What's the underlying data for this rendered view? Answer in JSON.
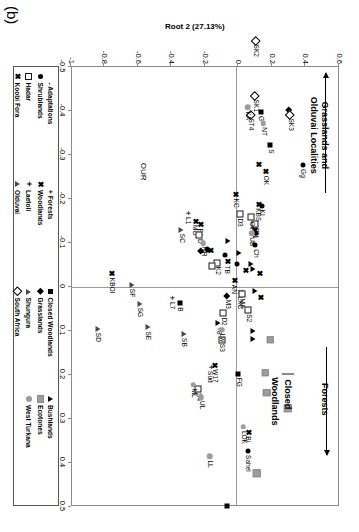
{
  "figure": {
    "panel_label": "(b)"
  },
  "chart_data": {
    "type": "scatter",
    "title": "",
    "xlabel": "Root 1 (45.45%)",
    "ylabel": "Root 2 (27.13%)",
    "xlim": [
      -0.5,
      0.5
    ],
    "ylim": [
      -1.0,
      0.6
    ],
    "xticks": [
      "-0.5",
      "-0.4",
      "-0.3",
      "-0.2",
      "-0.1",
      "0",
      "0.1",
      "0.2",
      "0.3",
      "0.4",
      "0.5"
    ],
    "xtick_values": [
      -0.5,
      -0.4,
      -0.3,
      -0.2,
      -0.1,
      0,
      0.1,
      0.2,
      0.3,
      0.4,
      0.5
    ],
    "yticks": [
      "0.6",
      "0.4",
      "0.2",
      "0",
      "-0.2",
      "-0.4",
      "-0.6",
      "-0.8",
      "-1"
    ],
    "ytick_values": [
      0.6,
      0.4,
      0.2,
      0,
      -0.2,
      -0.4,
      -0.6,
      -0.8,
      -1.0
    ],
    "grid": false,
    "zero_lines": true,
    "legend_position": "below-plot",
    "annotations": [
      {
        "name": "forests-annotation",
        "text": "Forests",
        "x": 0.255,
        "y": 0.52,
        "arrow": "horizontal-right"
      },
      {
        "name": "grasslands-annotation",
        "text": "Grasslands and\nOlduvai Localities",
        "x": -0.345,
        "y": 0.49,
        "arrow": "horizontal-left"
      },
      {
        "name": "our-annotation",
        "text": "OUR",
        "x": -0.262,
        "y": -0.565
      }
    ],
    "inline_key": [
      {
        "label": "Closed",
        "marker": "square-grey"
      },
      {
        "label": "Woodlands",
        "marker": "square-filled"
      }
    ],
    "series": [
      {
        "name": "Adaptations",
        "marker": "dash",
        "points": []
      },
      {
        "name": "Forests",
        "marker": "plus",
        "points": [
          {
            "label": "L1",
            "x": -0.168,
            "y": -0.3
          },
          {
            "label": "L7",
            "x": 0.025,
            "y": -0.395
          }
        ]
      },
      {
        "name": "Closed Woodlands",
        "marker": "square-filled",
        "points": [
          {
            "label": "S",
            "x": -0.322,
            "y": 0.195
          },
          {
            "label": "G",
            "x": -0.398,
            "y": 0.14
          },
          {
            "label": "B",
            "x": 0.037,
            "y": -0.345
          },
          {
            "label": "FG",
            "x": 0.197,
            "y": 0.005
          },
          {
            "label": "",
            "x": 0.498,
            "y": -0.065
          }
        ]
      },
      {
        "name": "Bushlands",
        "marker": "triangle-filled",
        "points": [
          {
            "label": "",
            "x": -0.053,
            "y": 0.078
          },
          {
            "label": "",
            "x": -0.04,
            "y": 0.095
          },
          {
            "label": "",
            "x": 0.01,
            "y": 0.105
          },
          {
            "label": "",
            "x": 0.1,
            "y": 0.095
          },
          {
            "label": "",
            "x": 0.118,
            "y": 0.095
          },
          {
            "label": "",
            "x": -0.078,
            "y": 0.008
          },
          {
            "label": "T8",
            "x": 0.082,
            "y": -0.115
          },
          {
            "label": "",
            "x": -0.104,
            "y": -0.055
          }
        ]
      },
      {
        "name": "Shrublands",
        "marker": "circle-filled",
        "points": [
          {
            "label": "Gg",
            "x": -0.277,
            "y": 0.39
          },
          {
            "label": "Sahel",
            "x": 0.373,
            "y": 0.06
          },
          {
            "label": "KI",
            "x": -0.185,
            "y": 0.145
          },
          {
            "label": "",
            "x": -0.122,
            "y": 0.11
          },
          {
            "label": "Ch",
            "x": -0.095,
            "y": 0.105
          },
          {
            "label": "",
            "x": -0.072,
            "y": -0.075
          },
          {
            "label": "",
            "x": -0.052,
            "y": -0.003
          },
          {
            "label": "",
            "x": -0.085,
            "y": -0.175
          },
          {
            "label": "",
            "x": -0.087,
            "y": -0.182
          }
        ]
      },
      {
        "name": "Woodlands",
        "marker": "x-mark",
        "points": [
          {
            "label": "Bi",
            "x": 0.33,
            "y": 0.06
          },
          {
            "label": "OK",
            "x": -0.262,
            "y": 0.165
          },
          {
            "label": "",
            "x": -0.278,
            "y": 0.125
          },
          {
            "label": "KBS",
            "x": -0.188,
            "y": 0.12
          },
          {
            "label": "K1",
            "x": -0.137,
            "y": 0.1
          },
          {
            "label": "",
            "x": -0.129,
            "y": 0.098
          },
          {
            "label": "KC",
            "x": -0.21,
            "y": -0.012
          },
          {
            "label": "",
            "x": 0.023,
            "y": 0.135
          },
          {
            "label": "",
            "x": -0.03,
            "y": 0.128
          },
          {
            "label": "",
            "x": -0.038,
            "y": 0.043
          },
          {
            "label": "LXC",
            "x": 0.013,
            "y": 0.013
          },
          {
            "label": "TB",
            "x": -0.058,
            "y": -0.065
          },
          {
            "label": "",
            "x": -0.083,
            "y": -0.165
          },
          {
            "label": "BA",
            "x": -0.142,
            "y": -0.225
          },
          {
            "label": "AN",
            "x": -0.014,
            "y": -0.023
          },
          {
            "label": "W17",
            "x": 0.178,
            "y": -0.14
          },
          {
            "label": "KBOI",
            "x": -0.03,
            "y": -0.755
          },
          {
            "label": "MO",
            "x": -0.15,
            "y": -0.255
          }
        ]
      },
      {
        "name": "Grasslands",
        "marker": "diamond-filled",
        "points": [
          {
            "label": "",
            "x": -0.402,
            "y": 0.31
          },
          {
            "label": "M3",
            "x": 0.02,
            "y": -0.06
          },
          {
            "label": "",
            "x": -0.082,
            "y": -0.22
          }
        ]
      },
      {
        "name": "Ecotones",
        "marker": "square-grey",
        "points": [
          {
            "label": "",
            "x": 0.12,
            "y": 0.195
          },
          {
            "label": "",
            "x": 0.195,
            "y": 0.165
          },
          {
            "label": "",
            "x": 0.24,
            "y": 0.175
          },
          {
            "label": "",
            "x": 0.275,
            "y": 0.3
          },
          {
            "label": "",
            "x": 0.423,
            "y": 0.115
          }
        ]
      },
      {
        "name": "Hadar",
        "marker": "square-open",
        "points": [
          {
            "label": "S2",
            "x": 0.053,
            "y": 0.065
          },
          {
            "label": "S3",
            "x": 0.12,
            "y": -0.095
          },
          {
            "label": "D2",
            "x": 0.06,
            "y": -0.085
          },
          {
            "label": "S4",
            "x": 0.232,
            "y": -0.235
          },
          {
            "label": "MA",
            "x": 0.017,
            "y": 0.025
          },
          {
            "label": "DN",
            "x": -0.143,
            "y": 0.105
          },
          {
            "label": "Ov",
            "x": -0.158,
            "y": 0.082
          },
          {
            "label": "D3",
            "x": -0.165,
            "y": 0.012
          },
          {
            "label": "D",
            "x": -0.118,
            "y": -0.228
          },
          {
            "label": "K2",
            "x": -0.055,
            "y": -0.12
          },
          {
            "label": "",
            "x": -0.048,
            "y": -0.152
          }
        ]
      },
      {
        "name": "Laetoli",
        "marker": "plus-small",
        "points": [
          {
            "label": "Sud",
            "x": 0.182,
            "y": -0.165
          }
        ]
      },
      {
        "name": "Shungura",
        "marker": "triangle-open",
        "points": [
          {
            "label": "SB",
            "x": 0.107,
            "y": -0.32
          },
          {
            "label": "SE",
            "x": 0.092,
            "y": -0.535
          },
          {
            "label": "SG",
            "x": 0.038,
            "y": -0.585
          },
          {
            "label": "SF",
            "x": -0.005,
            "y": -0.63
          },
          {
            "label": "SD",
            "x": 0.095,
            "y": -0.835
          },
          {
            "label": "SC",
            "x": -0.13,
            "y": -0.335
          }
        ]
      },
      {
        "name": "Koobi Fora",
        "marker": "x-bold",
        "points": []
      },
      {
        "name": "Olduvai",
        "marker": "triangle-open-small",
        "points": []
      },
      {
        "name": "South Africa",
        "marker": "diamond-open",
        "points": [
          {
            "label": "SK2",
            "x": -0.56,
            "y": 0.11
          },
          {
            "label": "SK1",
            "x": -0.435,
            "y": 0.105
          },
          {
            "label": "ST4",
            "x": -0.392,
            "y": 0.08
          },
          {
            "label": "SK3",
            "x": -0.392,
            "y": 0.315
          }
        ]
      },
      {
        "name": "West Turkana",
        "marker": "circle-grey",
        "points": [
          {
            "label": "LOK",
            "x": 0.318,
            "y": 0.035
          },
          {
            "label": "LL",
            "x": 0.385,
            "y": -0.165
          },
          {
            "label": "UL",
            "x": 0.25,
            "y": -0.215
          },
          {
            "label": "ML",
            "x": 0.222,
            "y": -0.265
          },
          {
            "label": "NT",
            "x": -0.372,
            "y": 0.155
          },
          {
            "label": "KA",
            "x": -0.408,
            "y": 0.06
          },
          {
            "label": "UB",
            "x": -0.122,
            "y": 0.085
          },
          {
            "label": "NR",
            "x": -0.1,
            "y": -0.205
          },
          {
            "label": "Lw",
            "x": 0.097,
            "y": -0.095
          }
        ]
      }
    ]
  },
  "legend": {
    "entries": [
      {
        "label": "- Adaptations",
        "marker": "dash"
      },
      {
        "label": "+ Forests",
        "marker": "plus"
      },
      {
        "label": "Closed Woodlands",
        "marker": "square-filled"
      },
      {
        "label": "Bushlands",
        "marker": "triangle-filled"
      },
      {
        "label": "Shrublands",
        "marker": "circle-filled"
      },
      {
        "label": "Woodlands",
        "marker": "x-mark"
      },
      {
        "label": "Grasslands",
        "marker": "diamond-filled"
      },
      {
        "label": "Ecotones",
        "marker": "square-grey"
      },
      {
        "label": "Hadar",
        "marker": "square-open"
      },
      {
        "label": "Laetoli",
        "marker": "plus-small"
      },
      {
        "label": "Shungura",
        "marker": "triangle-open"
      },
      {
        "label": "West Turkana",
        "marker": "circle-grey"
      },
      {
        "label": "Koobi Fora",
        "marker": "x-bold"
      },
      {
        "label": "Olduvai",
        "marker": "triangle-open-small"
      },
      {
        "label": "South Africa",
        "marker": "diamond-open"
      }
    ]
  }
}
